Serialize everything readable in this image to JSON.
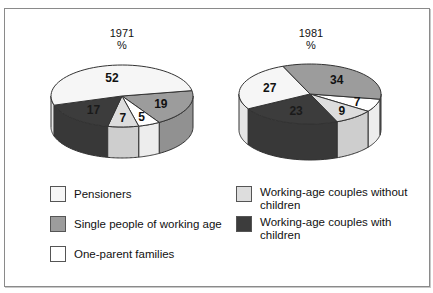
{
  "chart_data": [
    {
      "type": "pie",
      "title": "1971",
      "subtitle": "%",
      "style": "3d",
      "slices": [
        {
          "label": "Pensioners",
          "value": 52
        },
        {
          "label": "Single people of working age",
          "value": 19
        },
        {
          "label": "One-parent families",
          "value": 5
        },
        {
          "label": "Working-age couples without children",
          "value": 7
        },
        {
          "label": "Working-age couples with children",
          "value": 17
        }
      ]
    },
    {
      "type": "pie",
      "title": "1981",
      "subtitle": "%",
      "style": "3d",
      "slices": [
        {
          "label": "Pensioners",
          "value": 27
        },
        {
          "label": "Single people of working age",
          "value": 34
        },
        {
          "label": "One-parent families",
          "value": 7
        },
        {
          "label": "Working-age couples without children",
          "value": 9
        },
        {
          "label": "Working-age couples with children",
          "value": 23
        }
      ]
    }
  ],
  "pies": [
    {
      "title": "1971",
      "unit": "%"
    },
    {
      "title": "1981",
      "unit": "%"
    }
  ],
  "legend": [
    {
      "label": "Pensioners",
      "color": "#f6f6f6"
    },
    {
      "label": "Single people of working age",
      "color": "#9c9c9c"
    },
    {
      "label": "One-parent families",
      "color": "#ffffff"
    },
    {
      "label": "Working-age couples without children",
      "color": "#dddddd"
    },
    {
      "label": "Working-age couples with children",
      "color": "#3c3c3c"
    }
  ]
}
